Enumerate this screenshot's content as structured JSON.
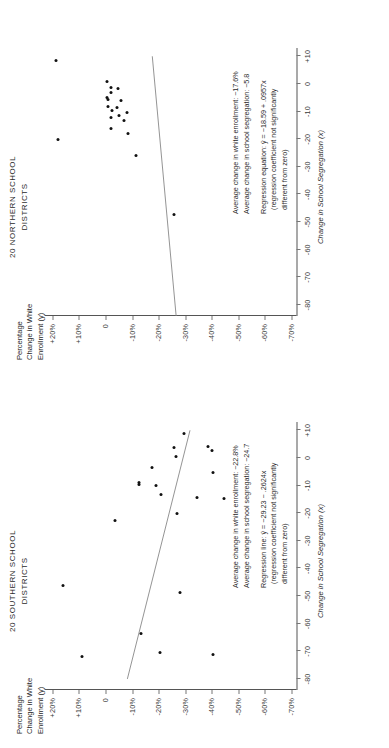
{
  "figure": {
    "axis_x_title": "Change in School Segregation (x)",
    "axis_y_title": "Percentage\nChange in White\nEnrollment (y)",
    "x_ticks": [
      "-80",
      "-70",
      "-60",
      "-50",
      "-40",
      "-30",
      "-20",
      "-10",
      "0",
      "+10"
    ],
    "x_tick_values": [
      -80,
      -70,
      -60,
      -50,
      -40,
      -30,
      -20,
      -10,
      0,
      10
    ],
    "y_ticks": [
      "+20%",
      "+10%",
      "0",
      "-10%",
      "-20%",
      "-30%",
      "-40%",
      "-50%",
      "-60%",
      "-70%"
    ],
    "y_tick_values": [
      20,
      10,
      0,
      -10,
      -20,
      -30,
      -40,
      -50,
      -60,
      -70
    ]
  },
  "chart_data": [
    {
      "type": "scatter",
      "id": "northern",
      "title": "20 NORTHERN SCHOOL\nDISTRICTS",
      "xlabel": "Change in School Segregation (x)",
      "ylabel": "Percentage Change in White Enrollment (y)",
      "xlim": [
        -84,
        13
      ],
      "ylim": [
        -72,
        23
      ],
      "grid": false,
      "points": [
        {
          "x": 8.6,
          "y": 18.5
        },
        {
          "x": -20.2,
          "y": 18.0
        },
        {
          "x": 1.0,
          "y": -0.5
        },
        {
          "x": -1.2,
          "y": -2.0
        },
        {
          "x": -1.8,
          "y": -4.6
        },
        {
          "x": -3.0,
          "y": -2.2
        },
        {
          "x": -5.0,
          "y": -0.4
        },
        {
          "x": -5.6,
          "y": -1.0
        },
        {
          "x": -6.0,
          "y": -5.8
        },
        {
          "x": -8.0,
          "y": -1.0
        },
        {
          "x": -8.6,
          "y": -4.4
        },
        {
          "x": -9.6,
          "y": -2.4
        },
        {
          "x": -10.4,
          "y": -8.0
        },
        {
          "x": -11.6,
          "y": -5.0
        },
        {
          "x": -12.0,
          "y": -2.0
        },
        {
          "x": -13.2,
          "y": -7.0
        },
        {
          "x": -16.0,
          "y": -2.0
        },
        {
          "x": -17.8,
          "y": -8.4
        },
        {
          "x": -26.0,
          "y": -11.6
        },
        {
          "x": -47.2,
          "y": -25.8
        }
      ],
      "regression": {
        "intercept": 18.59,
        "slope": 0.0957,
        "equation_display": "ŷ = −18.59 + .0957x",
        "line_from_x": -84,
        "line_to_x": 10
      },
      "annotations": {
        "avg_enrollment_label": "Average change in white enrollment:",
        "avg_enrollment_value": "−17.6%",
        "avg_segregation_label": "Average change in school segregation:",
        "avg_segregation_value": "−5.8",
        "regression_label": "Regression equation:",
        "regression_value": "ŷ =  −18.59 + .0957x",
        "footnote": "(regression coefficient not significantly\ndifferent from zero)"
      }
    },
    {
      "type": "scatter",
      "id": "southern",
      "title": "20 SOUTHERN SCHOOL\nDISTRICTS",
      "xlabel": "Change in School Segregation (x)",
      "ylabel": "Percentage Change in White Enrollment (y)",
      "xlim": [
        -84,
        13
      ],
      "ylim": [
        -72,
        23
      ],
      "grid": false,
      "points": [
        {
          "x": -46.0,
          "y": 16.0
        },
        {
          "x": -72.0,
          "y": 9.0
        },
        {
          "x": -22.6,
          "y": -3.4
        },
        {
          "x": 8.8,
          "y": -29.6
        },
        {
          "x": 3.6,
          "y": -25.8
        },
        {
          "x": 4.2,
          "y": -38.6
        },
        {
          "x": 2.8,
          "y": -40.0
        },
        {
          "x": 0.4,
          "y": -26.6
        },
        {
          "x": -3.6,
          "y": -17.6
        },
        {
          "x": -5.4,
          "y": -40.4
        },
        {
          "x": -8.8,
          "y": -12.8
        },
        {
          "x": -9.8,
          "y": -12.6
        },
        {
          "x": -10.0,
          "y": -19.2
        },
        {
          "x": -13.4,
          "y": -21.0
        },
        {
          "x": -14.4,
          "y": -34.4
        },
        {
          "x": -14.6,
          "y": -44.8
        },
        {
          "x": -20.0,
          "y": -27.0
        },
        {
          "x": -48.8,
          "y": -28.0
        },
        {
          "x": -63.4,
          "y": -13.4
        },
        {
          "x": -70.6,
          "y": -20.6
        },
        {
          "x": -71.0,
          "y": -40.4
        }
      ],
      "regression": {
        "intercept": 29.23,
        "slope": -0.2624,
        "equation_display": "ŷ = −29.23 − .2624x",
        "line_from_x": -80,
        "line_to_x": 10
      },
      "annotations": {
        "avg_enrollment_label": "Average change in white enrollment:",
        "avg_enrollment_value": "−22.8%",
        "avg_segregation_label": "Average change in school segregation:",
        "avg_segregation_value": "−24.7",
        "regression_label": "Regression line:",
        "regression_value": "ŷ =  −29.23 − .2624x",
        "footnote": "(regression coefficient not significantly\ndifferent from zero)"
      }
    }
  ]
}
